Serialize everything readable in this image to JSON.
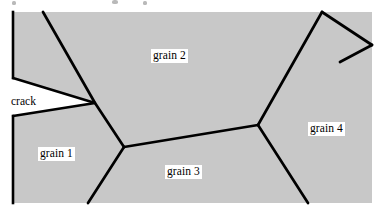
{
  "figure": {
    "kind": "grain-microstructure-schematic",
    "width": 378,
    "height": 217,
    "background_color": "#ffffff",
    "grain_fill_color": "#c8c8c8",
    "boundary_color": "#000000",
    "crack_fill_color": "#ffffff",
    "label_text_color": "#000000",
    "label_box_color": "#ffffff"
  },
  "labels": {
    "grain_1": "grain 1",
    "grain_2": "grain 2",
    "grain_3": "grain 3",
    "grain_4": "grain 4",
    "crack": "crack"
  },
  "geometry": {
    "specimen_outline": "M 13,12 L 372,12 L 372,203 L 13,203 Z",
    "crack_wedge": "M 13,78 L 95,103 L 13,116 Z",
    "boundary_grain1_grain2": "M 43,12 L 95,103 L 124,147",
    "boundary_grain1_grain3": "M 124,147 L 88,203",
    "boundary_grain3_grain2": "M 124,147 L 258,125",
    "boundary_grain2_grain4": "M 258,125 L 322,12",
    "boundary_grain3_grain4": "M 258,125 L 308,203",
    "boundary_topright_corner": "M 322,12 L 372,45",
    "boundary_rightedge_spur": "M 372,45 L 341,62"
  },
  "top_specks": [
    {
      "x": 12,
      "y": 1,
      "w": 4,
      "h": 4
    },
    {
      "x": 112,
      "y": 0,
      "w": 6,
      "h": 4
    },
    {
      "x": 143,
      "y": 1,
      "w": 4,
      "h": 4
    }
  ]
}
